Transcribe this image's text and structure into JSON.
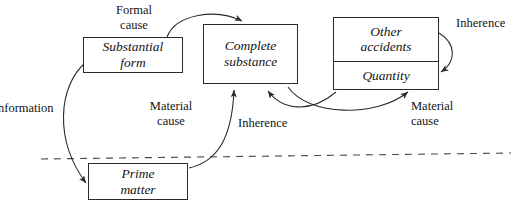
{
  "diagram": {
    "background_color": "#ffffff",
    "stroke_color": "#2b2b2b",
    "text_color": "#141414",
    "dashed_divider": {
      "name": "substantial-accidental-divider",
      "style": "dashed"
    },
    "nodes": [
      {
        "id": "substantial-form",
        "line1": "Substantial",
        "line2": "form"
      },
      {
        "id": "complete-substance",
        "line1": "Complete",
        "line2": "substance"
      },
      {
        "id": "other-accidents",
        "line1": "Other",
        "line2": "accidents"
      },
      {
        "id": "quantity",
        "line1": "Quantity",
        "line2": ""
      },
      {
        "id": "prime-matter",
        "line1": "Prime",
        "line2": "matter"
      }
    ],
    "labels": [
      {
        "id": "formal-cause",
        "line1": "Formal",
        "line2": "cause"
      },
      {
        "id": "inherence-top-right",
        "line1": "Inherence",
        "line2": ""
      },
      {
        "id": "material-cause-left",
        "line1": "Material",
        "line2": "cause"
      },
      {
        "id": "inherence-center",
        "line1": "Inherence",
        "line2": ""
      },
      {
        "id": "material-cause-right",
        "line1": "Material",
        "line2": "cause"
      },
      {
        "id": "information-left",
        "line1": "nformation",
        "line2": ""
      }
    ]
  }
}
